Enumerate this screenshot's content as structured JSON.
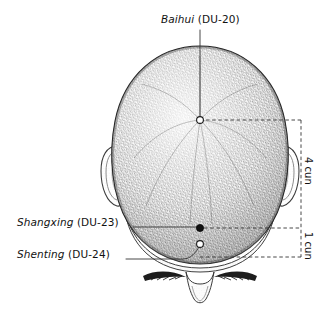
{
  "figure": {
    "type": "anatomical-illustration",
    "background_color": "#ffffff",
    "ink_color": "#1a1a1a"
  },
  "labels": {
    "baihui": {
      "name": "Baihui",
      "code": "(DU-20)"
    },
    "shangxing": {
      "name": "Shangxing",
      "code": "(DU-23)"
    },
    "shenting": {
      "name": "Shenting",
      "code": "(DU-24)"
    }
  },
  "measurements": {
    "upper": "4 cun",
    "lower": "1 cun"
  },
  "points": [
    {
      "id": "DU-20",
      "label": "Baihui",
      "marker": "hollow-circle",
      "x": 200,
      "y": 120
    },
    {
      "id": "DU-23",
      "label": "Shangxing",
      "marker": "filled-circle",
      "x": 200,
      "y": 228
    },
    {
      "id": "DU-24",
      "label": "Shenting",
      "marker": "hollow-circle",
      "x": 200,
      "y": 244
    }
  ]
}
